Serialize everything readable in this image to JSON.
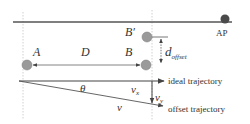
{
  "diagram": {
    "type": "geometry-trajectory-offset",
    "colors": {
      "background": "#ffffff",
      "line": "#555555",
      "dotted": "#b8b8b8",
      "node_fill": "#9a9a9a",
      "node_stroke": "#7a7a7a",
      "ap_fill": "#4a4a4a",
      "text": "#333333"
    },
    "nodes": {
      "A": {
        "label": "A"
      },
      "B": {
        "label": "B"
      },
      "B_prime": {
        "label": "B′"
      },
      "AP": {
        "label": "AP"
      }
    },
    "labels": {
      "distance": "D",
      "offset_main": "d",
      "offset_sub": "offset",
      "angle": "θ",
      "vx_main": "v",
      "vx_sub": "x",
      "vy_main": "v",
      "vy_sub": "y",
      "velocity": "v",
      "ideal_trajectory": "ideal trajectory",
      "offset_trajectory": "offset trajectory"
    }
  }
}
